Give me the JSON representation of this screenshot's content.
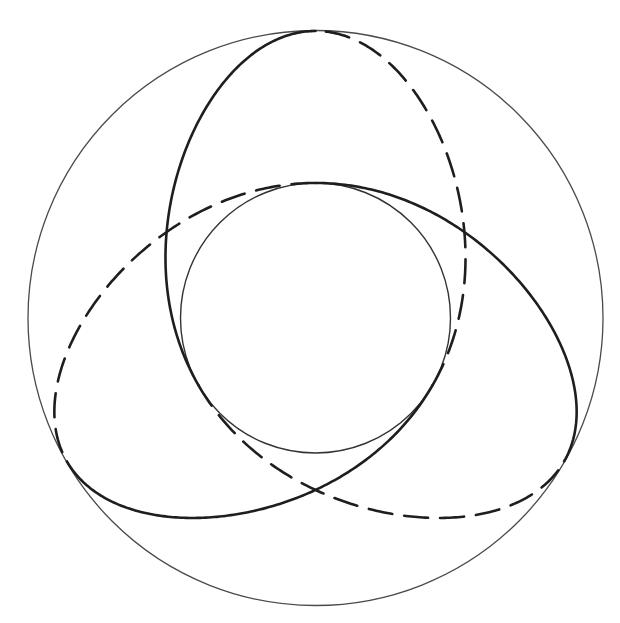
{
  "diagram": {
    "title": "",
    "canvas": {
      "width": 620,
      "height": 623,
      "background": "#ffffff"
    },
    "center": {
      "x": 315.5,
      "y": 318
    },
    "outer_circle": {
      "radius": 287.5,
      "stroke": "#4a4a4a",
      "stroke_width": 1.3
    },
    "inner_circle": {
      "radius": 135,
      "stroke": "#333333",
      "stroke_width": 1.4
    },
    "trefoil_curve": {
      "description": "Single closed 3-fold symmetric curve, tangent to the outer circle at 3 points and to the inner circle at 3 points, winding twice around the center; drawn in 6 alternating solid/dashed arcs",
      "harmonics": [
        {
          "amplitude": 203.4,
          "frequency": -2
        },
        {
          "amplitude": 76.0,
          "frequency": 1
        },
        {
          "amplitude": 7.6,
          "frequency": 4
        }
      ],
      "rotation_deg": -90,
      "stroke": "#1e1e1e",
      "stroke_width": 2.6,
      "dash_pattern": "24 12",
      "segments": [
        {
          "name": "upper-lobe-left-solid",
          "style": "solid",
          "t_start_pi": 0,
          "t_end_pi": 0.3333
        },
        {
          "name": "lower-right-dashed",
          "style": "dashed",
          "t_start_pi": 0.3333,
          "t_end_pi": 0.6667
        },
        {
          "name": "right-lobe-upper-solid",
          "style": "solid",
          "t_start_pi": 0.6667,
          "t_end_pi": 1.0
        },
        {
          "name": "upper-left-dashed",
          "style": "dashed",
          "t_start_pi": 1.0,
          "t_end_pi": 1.3333
        },
        {
          "name": "left-lobe-bottom-solid",
          "style": "solid",
          "t_start_pi": 1.3333,
          "t_end_pi": 1.6667
        },
        {
          "name": "upper-right-dashed",
          "style": "dashed",
          "t_start_pi": 1.6667,
          "t_end_pi": 2.0
        }
      ]
    },
    "tangent_points": {
      "outer": [
        {
          "label": "top",
          "x": 316,
          "y": 31
        },
        {
          "label": "lower-right",
          "x": 575,
          "y": 440
        },
        {
          "label": "lower-left",
          "x": 72,
          "y": 477
        }
      ],
      "inner": [
        {
          "label": "top",
          "x": 316,
          "y": 183
        },
        {
          "label": "lower-left",
          "x": 199,
          "y": 386
        },
        {
          "label": "lower-right",
          "x": 432,
          "y": 386
        }
      ]
    }
  }
}
